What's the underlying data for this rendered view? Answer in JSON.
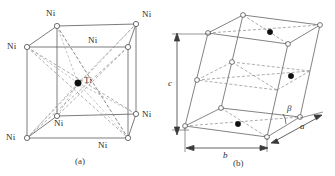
{
  "figure": {
    "background_color": "#ffffff",
    "line_color": "#555555",
    "dash_color": "#777777",
    "text_color": "#2b2b2b"
  },
  "panel_a": {
    "caption": "(a)",
    "center_atom": {
      "label": "Ti",
      "symbol": "Ti",
      "marker": "filled-circle",
      "color": "#000000"
    },
    "corner_atom_symbol": "Ni",
    "corner_marker": "open-circle",
    "corner_atoms": [
      {
        "label": "Ni",
        "position": "top-back-left"
      },
      {
        "label": "Ni",
        "position": "top-back-right"
      },
      {
        "label": "Ni",
        "position": "top-front-left"
      },
      {
        "label": "Ni",
        "position": "top-front-right"
      },
      {
        "label": "Ni",
        "position": "bottom-back-left"
      },
      {
        "label": "Ni",
        "position": "bottom-back-right"
      },
      {
        "label": "Ni",
        "position": "bottom-front-left"
      },
      {
        "label": "Ni",
        "position": "bottom-front-right"
      }
    ]
  },
  "panel_b": {
    "caption": "(b)",
    "lattice_parameters": {
      "a": "a",
      "b": "b",
      "c": "c",
      "beta": "β"
    },
    "open_atom_marker": "open-circle",
    "filled_atom_marker": "filled-circle",
    "filled_atom_count": 3,
    "planes": [
      "top",
      "middle",
      "bottom"
    ]
  }
}
